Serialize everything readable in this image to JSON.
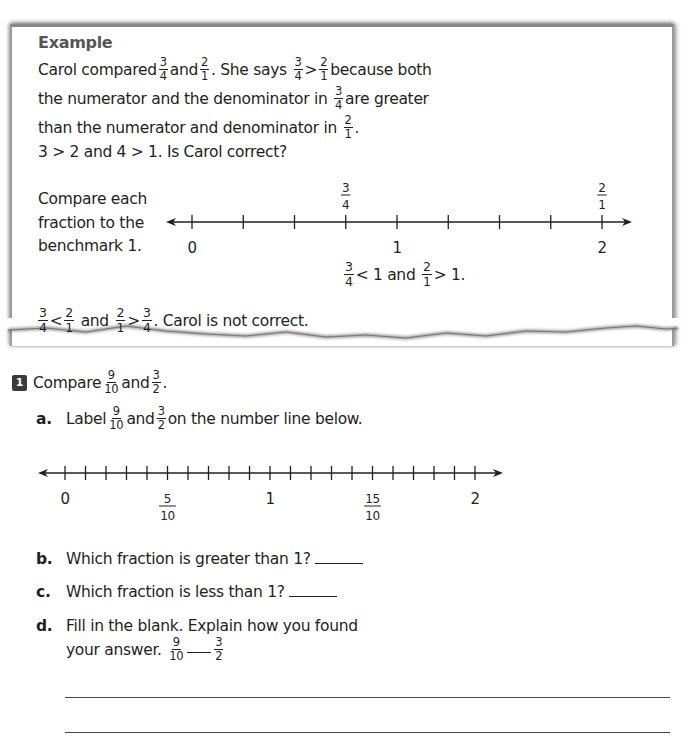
{
  "example": {
    "title": "Example",
    "line1": {
      "a": "Carol compared",
      "f1": {
        "n": "3",
        "d": "4"
      },
      "b": "and",
      "f2": {
        "n": "2",
        "d": "1"
      },
      "c": ". She says",
      "f3": {
        "n": "3",
        "d": "4"
      },
      "op": ">",
      "f4": {
        "n": "2",
        "d": "1"
      },
      "e": "because both"
    },
    "line2": {
      "a": "the numerator and the denominator in",
      "f1": {
        "n": "3",
        "d": "4"
      },
      "b": "are greater"
    },
    "line3": {
      "a": "than the numerator and denominator in",
      "f1": {
        "n": "2",
        "d": "1"
      },
      "b": "."
    },
    "line4": "3 > 2 and 4 > 1. Is Carol correct?",
    "side_note": [
      "Compare each",
      "fraction to the",
      "benchmark 1."
    ],
    "number_line": {
      "ticks": 9,
      "labels_below": [
        {
          "pos": 0,
          "text": "0"
        },
        {
          "pos": 4,
          "text": "1"
        },
        {
          "pos": 8,
          "text": "2"
        }
      ],
      "labels_above": [
        {
          "pos": 3,
          "n": "3",
          "d": "4"
        },
        {
          "pos": 8,
          "n": "2",
          "d": "1"
        }
      ]
    },
    "benchmark_result": {
      "f1": {
        "n": "3",
        "d": "4"
      },
      "a": "< 1 and",
      "f2": {
        "n": "2",
        "d": "1"
      },
      "b": "> 1."
    },
    "conclusion": {
      "f1": {
        "n": "3",
        "d": "4"
      },
      "op1": "<",
      "f2": {
        "n": "2",
        "d": "1"
      },
      "a": "and",
      "f3": {
        "n": "2",
        "d": "1"
      },
      "op2": ">",
      "f4": {
        "n": "3",
        "d": "4"
      },
      "b": ". Carol is not correct."
    }
  },
  "problem": {
    "number": "1",
    "prompt": {
      "a": "Compare",
      "f1": {
        "n": "9",
        "d": "10"
      },
      "b": "and",
      "f2": {
        "n": "3",
        "d": "2"
      },
      "c": "."
    },
    "part_a": {
      "letter": "a.",
      "a": "Label",
      "f1": {
        "n": "9",
        "d": "10"
      },
      "b": "and",
      "f2": {
        "n": "3",
        "d": "2"
      },
      "c": "on the number line below."
    },
    "number_line": {
      "ticks": 21,
      "labels": [
        {
          "pos": 0,
          "text": "0"
        },
        {
          "pos": 5,
          "n": "5",
          "d": "10"
        },
        {
          "pos": 10,
          "text": "1"
        },
        {
          "pos": 15,
          "n": "15",
          "d": "10"
        },
        {
          "pos": 20,
          "text": "2"
        }
      ]
    },
    "part_b": {
      "letter": "b.",
      "text": "Which fraction is greater than 1?"
    },
    "part_c": {
      "letter": "c.",
      "text": "Which fraction is less than 1?"
    },
    "part_d": {
      "letter": "d.",
      "line1": "Fill in the blank. Explain how you found",
      "line2": "your answer.",
      "f1": {
        "n": "9",
        "d": "10"
      },
      "f2": {
        "n": "3",
        "d": "2"
      }
    }
  }
}
